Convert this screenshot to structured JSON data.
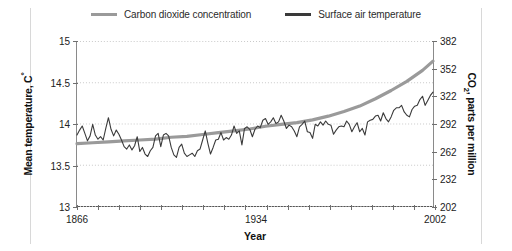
{
  "legend": {
    "position": "top-center",
    "items": [
      {
        "label": "Carbon dioxide concentration",
        "color": "#9a9a9a",
        "key": "co2"
      },
      {
        "label": "Surface air temperature",
        "color": "#3a3a3a",
        "key": "temp"
      }
    ]
  },
  "axis_titles": {
    "left": "Mean temperature, C°",
    "right": "CO₂, parts per million",
    "bottom": "Year"
  },
  "chart_data": {
    "type": "line",
    "title": "",
    "subtitle": "",
    "xlabel": "Year",
    "ylabel": "Mean temperature, C°",
    "ylabel_secondary": "CO₂, parts per million",
    "grid": true,
    "grid_style": "dotted-horizontal",
    "legend_position": "top-center",
    "xlim": [
      1866,
      2002
    ],
    "xticks": [
      1866,
      1934,
      2002
    ],
    "xtick_labels": [
      "1866",
      "1934",
      "2002"
    ],
    "x_minor_tick_count": 17,
    "ylim": [
      13,
      15
    ],
    "yticks": [
      13,
      13.5,
      14,
      14.5,
      15
    ],
    "ytick_labels": [
      "13",
      "13.5",
      "14",
      "14.5",
      "15"
    ],
    "ylim_secondary": [
      202,
      382
    ],
    "yticks_secondary": [
      202,
      232,
      262,
      292,
      322,
      352,
      382
    ],
    "ytick_labels_secondary": [
      "202",
      "232",
      "262",
      "292",
      "322",
      "352",
      "382"
    ],
    "series": [
      {
        "name": "Carbon dioxide concentration",
        "key": "co2",
        "color": "#9a9a9a",
        "axis": "right",
        "width": 3.2,
        "x": [
          1866,
          1872,
          1878,
          1884,
          1890,
          1896,
          1902,
          1908,
          1914,
          1920,
          1926,
          1932,
          1938,
          1944,
          1950,
          1956,
          1962,
          1968,
          1974,
          1980,
          1986,
          1992,
          1998,
          2002
        ],
        "values": [
          270,
          271,
          272,
          273,
          274,
          275,
          277,
          278,
          280,
          282,
          284,
          286,
          289,
          291,
          293,
          296,
          300,
          305,
          311,
          319,
          328,
          338,
          350,
          360
        ]
      },
      {
        "name": "Surface air temperature",
        "key": "temp",
        "color": "#3a3a3a",
        "axis": "left",
        "width": 1.1,
        "x": [
          1866,
          1867,
          1868,
          1869,
          1870,
          1871,
          1872,
          1873,
          1874,
          1875,
          1876,
          1877,
          1878,
          1879,
          1880,
          1881,
          1882,
          1883,
          1884,
          1885,
          1886,
          1887,
          1888,
          1889,
          1890,
          1891,
          1892,
          1893,
          1894,
          1895,
          1896,
          1897,
          1898,
          1899,
          1900,
          1901,
          1902,
          1903,
          1904,
          1905,
          1906,
          1907,
          1908,
          1909,
          1910,
          1911,
          1912,
          1913,
          1914,
          1915,
          1916,
          1917,
          1918,
          1919,
          1920,
          1921,
          1922,
          1923,
          1924,
          1925,
          1926,
          1927,
          1928,
          1929,
          1930,
          1931,
          1932,
          1933,
          1934,
          1935,
          1936,
          1937,
          1938,
          1939,
          1940,
          1941,
          1942,
          1943,
          1944,
          1945,
          1946,
          1947,
          1948,
          1949,
          1950,
          1951,
          1952,
          1953,
          1954,
          1955,
          1956,
          1957,
          1958,
          1959,
          1960,
          1961,
          1962,
          1963,
          1964,
          1965,
          1966,
          1967,
          1968,
          1969,
          1970,
          1971,
          1972,
          1973,
          1974,
          1975,
          1976,
          1977,
          1978,
          1979,
          1980,
          1981,
          1982,
          1983,
          1984,
          1985,
          1986,
          1987,
          1988,
          1989,
          1990,
          1991,
          1992,
          1993,
          1994,
          1995,
          1996,
          1997,
          1998,
          1999,
          2000,
          2001,
          2002
        ],
        "values": [
          13.86,
          13.92,
          13.97,
          13.88,
          13.79,
          13.85,
          13.99,
          13.86,
          13.81,
          13.84,
          13.8,
          13.94,
          14.07,
          13.93,
          13.85,
          13.92,
          13.87,
          13.8,
          13.72,
          13.69,
          13.74,
          13.68,
          13.73,
          13.84,
          13.66,
          13.71,
          13.63,
          13.6,
          13.67,
          13.71,
          13.85,
          13.88,
          13.72,
          13.86,
          13.88,
          13.85,
          13.71,
          13.62,
          13.59,
          13.71,
          13.75,
          13.64,
          13.6,
          13.62,
          13.64,
          13.6,
          13.67,
          13.69,
          13.8,
          13.91,
          13.76,
          13.63,
          13.71,
          13.8,
          13.81,
          13.89,
          13.8,
          13.83,
          13.81,
          13.86,
          13.97,
          13.88,
          13.91,
          13.74,
          13.94,
          13.96,
          13.93,
          13.84,
          13.93,
          13.97,
          13.95,
          14.04,
          14.06,
          13.99,
          14.02,
          14.07,
          14.0,
          14.02,
          14.1,
          14.03,
          13.94,
          13.98,
          13.96,
          13.91,
          13.84,
          13.96,
          13.99,
          14.03,
          13.9,
          13.89,
          13.82,
          13.99,
          13.97,
          14.02,
          13.98,
          14.03,
          13.99,
          13.98,
          13.87,
          13.92,
          13.96,
          13.97,
          13.96,
          14.03,
          13.99,
          13.9,
          13.96,
          14.01,
          13.9,
          13.94,
          13.86,
          14.02,
          14.04,
          14.05,
          14.09,
          14.1,
          14.03,
          14.13,
          14.06,
          14.02,
          14.08,
          14.16,
          14.19,
          14.19,
          14.22,
          14.14,
          14.1,
          14.08,
          14.17,
          14.21,
          14.22,
          14.29,
          14.33,
          14.22,
          14.28,
          14.34,
          14.38
        ]
      }
    ]
  }
}
